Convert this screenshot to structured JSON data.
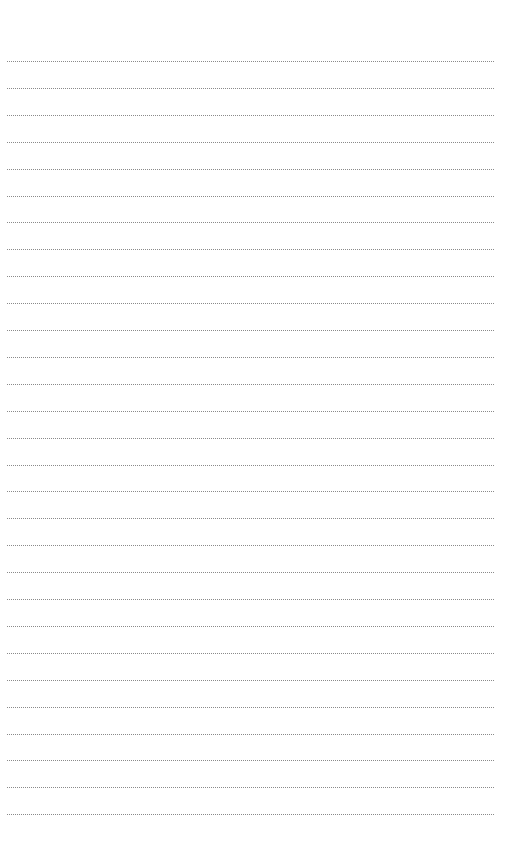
{
  "page": {
    "type": "lined-paper",
    "line_count": 29,
    "line_style": "dotted",
    "line_color": "#8a8a8a",
    "background": "#ffffff",
    "first_line_y": 61,
    "line_spacing": 26.9,
    "line_left": 7,
    "line_width": 487
  }
}
